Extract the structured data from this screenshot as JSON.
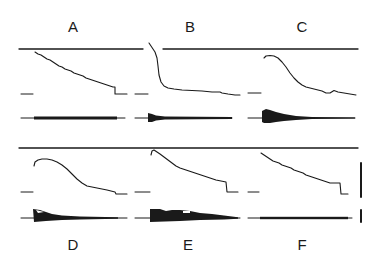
{
  "figure": {
    "panels": [
      {
        "id": "A",
        "label": "A",
        "x": 73,
        "y": 18,
        "description": "gradual linear-like decay with noisy trace; low envelope amplitude"
      },
      {
        "id": "B",
        "label": "B",
        "x": 190,
        "y": 18,
        "description": "fast early drop then slow plateau; brief envelope transient at onset"
      },
      {
        "id": "C",
        "label": "C",
        "x": 302,
        "y": 18,
        "description": "sigmoidal decline after plateau; larger decaying envelope"
      },
      {
        "id": "D",
        "label": "D",
        "x": 73,
        "y": 236,
        "description": "rise to peak then slow sigmoidal decline; large decaying envelope"
      },
      {
        "id": "E",
        "label": "E",
        "x": 188,
        "y": 236,
        "description": "brief peak then linear decline with step; large irregular envelope"
      },
      {
        "id": "F",
        "label": "F",
        "x": 302,
        "y": 236,
        "description": "noisy linear decay; low constant envelope"
      }
    ],
    "scale_bars": [
      {
        "name": "vertical-scale-bar-trace",
        "x": 361,
        "y1": 163,
        "y2": 197
      },
      {
        "name": "vertical-scale-bar-envelope",
        "x": 361,
        "y1": 210,
        "y2": 222
      }
    ],
    "colors": {
      "ink": "#1a1a1a",
      "background": "#ffffff"
    }
  }
}
